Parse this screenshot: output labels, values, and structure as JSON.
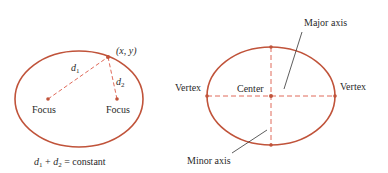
{
  "colors": {
    "curve": "#c0533a",
    "dash": "#e06a5a",
    "text": "#2a2a2a",
    "leader": "#333333"
  },
  "left_diagram": {
    "point_label": "(x, y)",
    "d1_var": "d",
    "d1_sub": "1",
    "d2_var": "d",
    "d2_sub": "2",
    "focus_left": "Focus",
    "focus_right": "Focus",
    "equation": {
      "t1": "d",
      "s1": "1",
      "plus": " + ",
      "t2": "d",
      "s2": "2",
      "rest": " = constant"
    }
  },
  "right_diagram": {
    "major_axis": "Major axis",
    "minor_axis": "Minor axis",
    "vertex_left": "Vertex",
    "vertex_right": "Vertex",
    "center": "Center"
  }
}
